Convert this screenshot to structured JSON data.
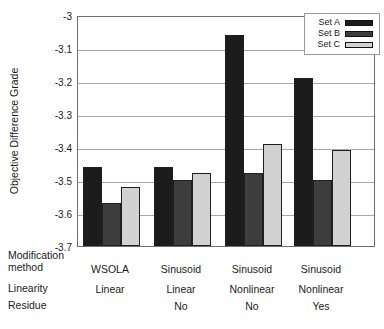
{
  "chart_data": {
    "type": "bar",
    "title": "",
    "xlabel": "",
    "ylabel": "Objective Difference Grade",
    "ylim": [
      -3.7,
      -3.0
    ],
    "ytick_labels": [
      "-3",
      "-3.1",
      "-3.2",
      "-3.3",
      "-3.4",
      "-3.5",
      "-3.6",
      "-3.7"
    ],
    "grid": true,
    "legend_position": "top-right-inside",
    "category_rows": [
      {
        "label": "Modification method",
        "key": "modification_method"
      },
      {
        "label": "Linearity",
        "key": "linearity"
      },
      {
        "label": "Residue",
        "key": "residue"
      }
    ],
    "categories": [
      {
        "modification_method": "WSOLA",
        "linearity": "Linear",
        "residue": ""
      },
      {
        "modification_method": "Sinusoid",
        "linearity": "Linear",
        "residue": "No"
      },
      {
        "modification_method": "Sinusoid",
        "linearity": "Nonlinear",
        "residue": "No"
      },
      {
        "modification_method": "Sinusoid",
        "linearity": "Nonlinear",
        "residue": "Yes"
      }
    ],
    "series": [
      {
        "name": "Set A",
        "color": "#1c1c1c",
        "values": [
          -3.46,
          -3.46,
          -3.06,
          -3.19
        ]
      },
      {
        "name": "Set B",
        "color": "#3d3d3d",
        "values": [
          -3.57,
          -3.5,
          -3.48,
          -3.5
        ]
      },
      {
        "name": "Set C",
        "color": "#d2d2d2",
        "values": [
          -3.52,
          -3.48,
          -3.39,
          -3.41
        ]
      }
    ]
  },
  "colors": {
    "background": "#ffffff",
    "axis_border": "#6e6e6e",
    "gridline": "#a8a8a8",
    "bar_outline": "#1f1f1f",
    "text": "#1a1a1a",
    "legend_border": "#9a9a9a"
  }
}
